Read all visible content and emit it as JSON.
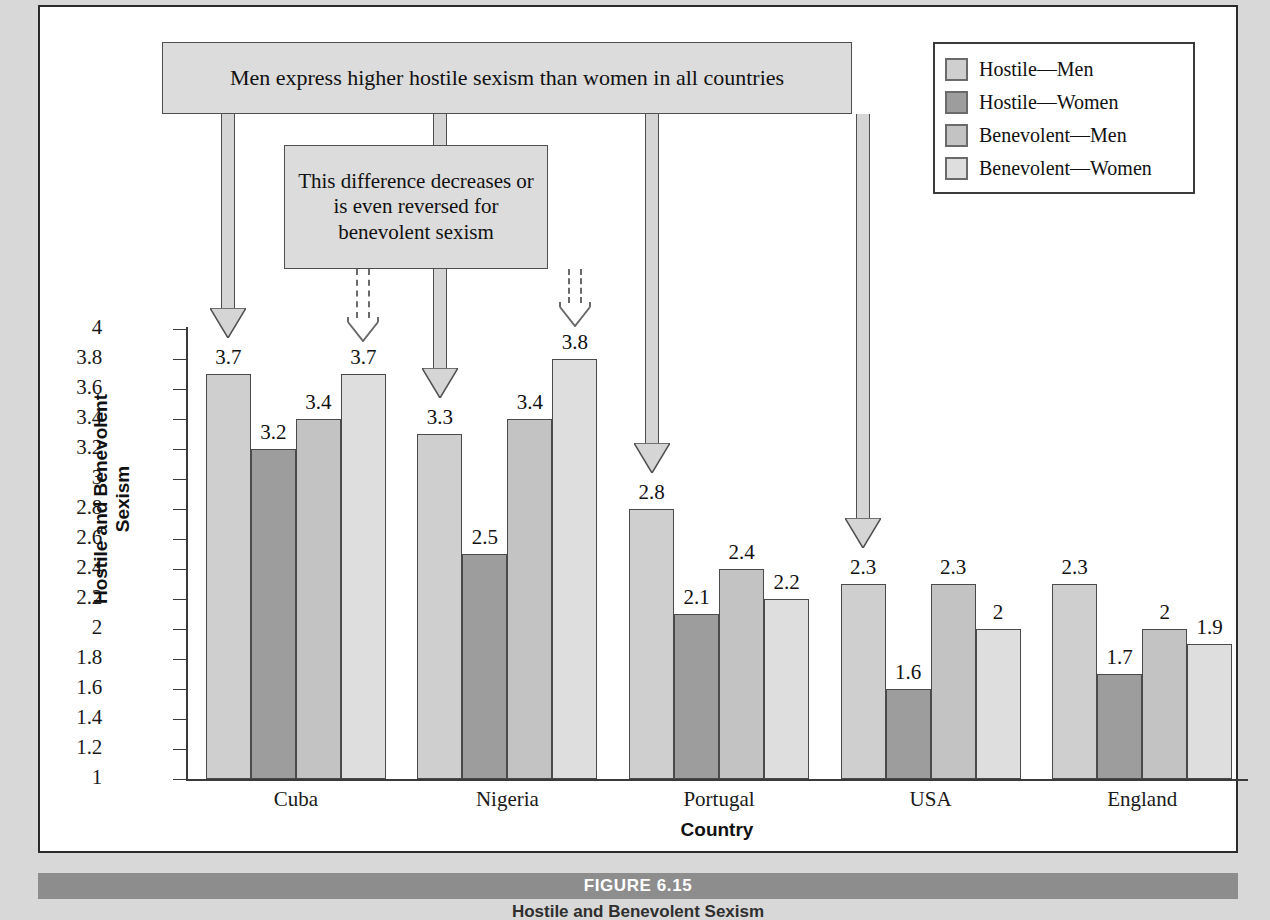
{
  "figure": {
    "caption_bar_label": "FIGURE 6.15",
    "caption_text": "Hostile and Benevolent Sexism"
  },
  "legend": {
    "items": [
      {
        "label": "Hostile—Men",
        "color": "#cfcfcf"
      },
      {
        "label": "Hostile—Women",
        "color": "#9d9d9d"
      },
      {
        "label": "Benevolent—Men",
        "color": "#c3c3c3"
      },
      {
        "label": "Benevolent—Women",
        "color": "#dedede"
      }
    ]
  },
  "annotations": [
    {
      "id": "callout-top",
      "text": "Men express higher hostile sexism than women in all countries"
    },
    {
      "id": "callout-second",
      "text": "This difference decreases or is even reversed for benevolent sexism"
    }
  ],
  "chart_data": {
    "type": "bar",
    "title": "",
    "xlabel": "Country",
    "ylabel": "Hostile and Benevolent Sexism",
    "ylim": [
      1,
      4
    ],
    "ytick_step": 0.2,
    "grid": false,
    "legend_position": "top-right",
    "yticks": [
      "1",
      "1.2",
      "1.4",
      "1.6",
      "1.8",
      "2",
      "2.2",
      "2.4",
      "2.6",
      "2.8",
      "3",
      "3.2",
      "3.4",
      "3.6",
      "3.8",
      "4"
    ],
    "categories": [
      "Cuba",
      "Nigeria",
      "Portugal",
      "USA",
      "England"
    ],
    "series": [
      {
        "name": "Hostile—Men",
        "values": [
          3.7,
          3.3,
          2.8,
          2.3,
          2.3
        ],
        "labels": [
          "3.7",
          "3.3",
          "2.8",
          "2.3",
          "2.3"
        ]
      },
      {
        "name": "Hostile—Women",
        "values": [
          3.2,
          2.5,
          2.1,
          1.6,
          1.7
        ],
        "labels": [
          "3.2",
          "2.5",
          "2.1",
          "1.6",
          "1.7"
        ]
      },
      {
        "name": "Benevolent—Men",
        "values": [
          3.4,
          3.4,
          2.4,
          2.3,
          2.0
        ],
        "labels": [
          "3.4",
          "3.4",
          "2.4",
          "2.3",
          "2"
        ]
      },
      {
        "name": "Benevolent—Women",
        "values": [
          3.7,
          3.8,
          2.2,
          2.0,
          1.9
        ],
        "labels": [
          "3.7",
          "3.8",
          "2.2",
          "2",
          "1.9"
        ]
      }
    ]
  }
}
